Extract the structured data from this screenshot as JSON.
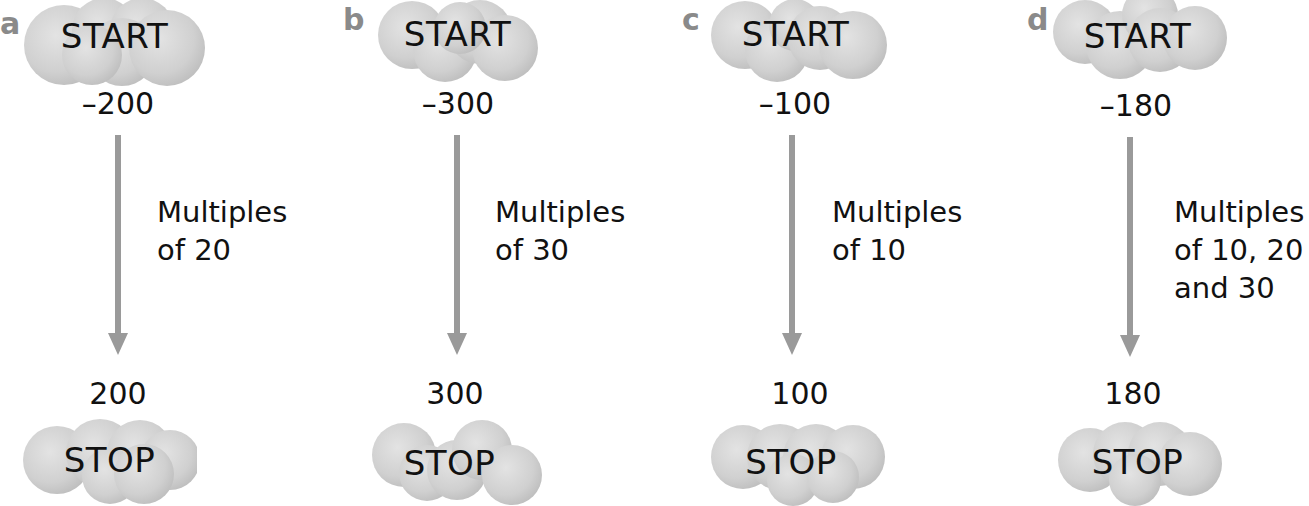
{
  "colors": {
    "cloud_fill": "#d2d2d2",
    "cloud_edge": "#bdbdbd",
    "arrow": "#9a9a9a",
    "letter": "#8a8a8a",
    "text": "#111111"
  },
  "panels": [
    {
      "letter": "a",
      "start_label": "START",
      "start_value": "–200",
      "rule_lines": [
        "Multiples",
        "of 20"
      ],
      "stop_value": "200",
      "stop_label": "STOP"
    },
    {
      "letter": "b",
      "start_label": "START",
      "start_value": "–300",
      "rule_lines": [
        "Multiples",
        "of 30"
      ],
      "stop_value": "300",
      "stop_label": "STOP"
    },
    {
      "letter": "c",
      "start_label": "START",
      "start_value": "–100",
      "rule_lines": [
        "Multiples",
        "of 10"
      ],
      "stop_value": "100",
      "stop_label": "STOP"
    },
    {
      "letter": "d",
      "start_label": "START",
      "start_value": "–180",
      "rule_lines": [
        "Multiples",
        "of 10, 20",
        "and 30"
      ],
      "stop_value": "180",
      "stop_label": "STOP"
    }
  ]
}
